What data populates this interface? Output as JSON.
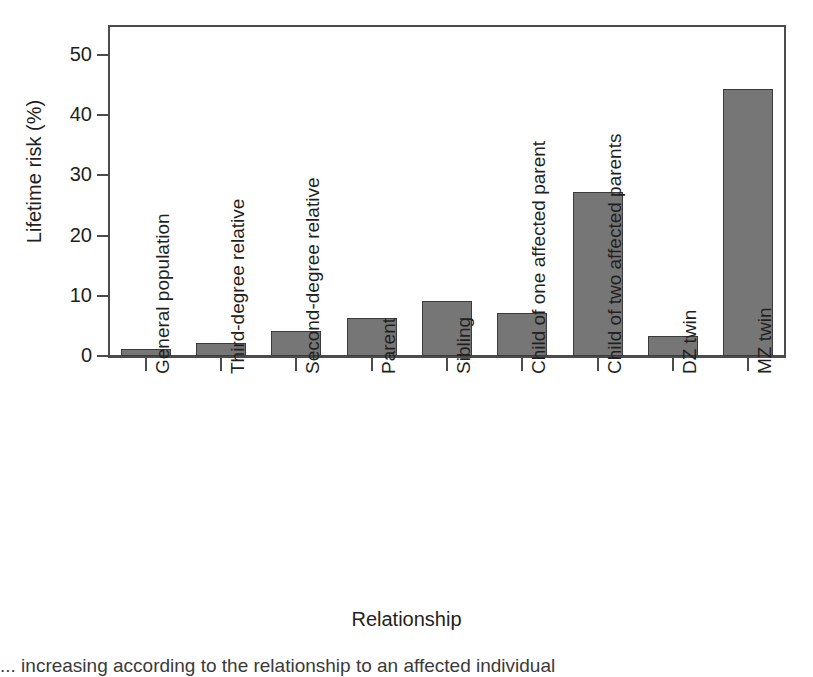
{
  "chart_data": {
    "type": "bar",
    "title": "",
    "xlabel": "Relationship",
    "ylabel": "Lifetime risk (%)",
    "ylim": [
      0,
      55
    ],
    "yticks": [
      0,
      10,
      20,
      30,
      40,
      50
    ],
    "grid": false,
    "legend": "none",
    "bar_color": "#767676",
    "bar_edge_color": "#3b3b3b",
    "axis_color": "#4b4b4b",
    "categories": [
      "General population",
      "Third-degree relative",
      "Second-degree relative",
      "Parent",
      "Sibling",
      "Child of one affected parent",
      "Child of two affected parents",
      "DZ twin",
      "MZ twin"
    ],
    "values": [
      1.2,
      2.2,
      4.2,
      6.3,
      9.2,
      7.2,
      27.3,
      3.3,
      44.4
    ]
  },
  "caption": "... increasing according to the relationship to an affected individual"
}
